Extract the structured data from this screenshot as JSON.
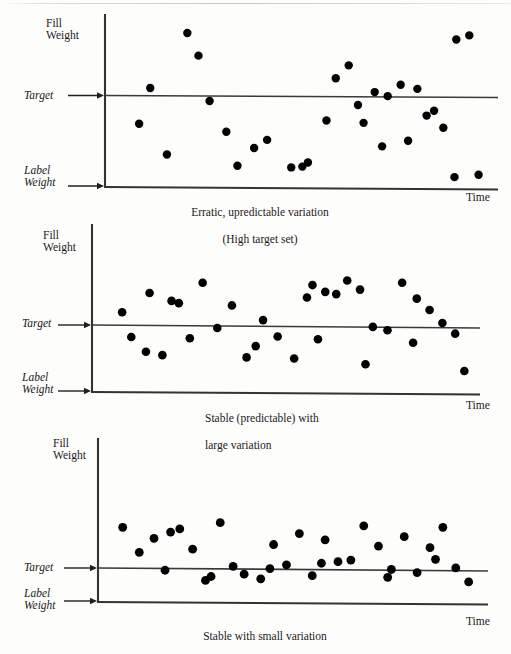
{
  "page": {
    "background_color": "#fdfdfc",
    "ink_color": "#000000",
    "axis_color": "#333333"
  },
  "common_labels": {
    "fill_weight": "Fill\nWeight",
    "fill_weight_line1": "Fill",
    "fill_weight_line2": "Weight",
    "target": "Target",
    "label_weight_line1": "Label",
    "label_weight_line2": "Weight",
    "time": "Time"
  },
  "chart_data": [
    {
      "id": "chart-erratic",
      "type": "scatter",
      "title": "",
      "caption": "Erratic, upredictable variation\n(High target set)",
      "caption_line1": "Erratic, upredictable variation",
      "caption_line2": "(High target set)",
      "caption_align": "center",
      "xlabel": "Time",
      "ylabel": "Fill Weight",
      "ylim": [
        0,
        100
      ],
      "xlim": [
        0,
        100
      ],
      "grid": false,
      "legend": "none",
      "annotations": [
        {
          "name": "Target",
          "y": 55.0,
          "style": "horizontal-line-with-arrow"
        },
        {
          "name": "Label Weight",
          "y": 0.0,
          "style": "axis-with-arrow"
        }
      ],
      "target_level": 55.0,
      "label_weight_level": 0.0,
      "x": [
        6.5,
        19.5,
        25.5,
        22.5,
        9.5,
        14.0,
        33.0,
        37.5,
        30.0,
        41.0,
        47.5,
        52.0,
        57.0,
        50.5,
        63.0,
        65.5,
        70.0,
        59.5,
        73.5,
        77.0,
        81.5,
        86.0,
        72.0,
        67.0,
        84.0,
        88.5,
        79.0,
        92.0,
        95.5,
        98.0,
        91.5,
        27.0,
        44.0
      ],
      "y": [
        36.0,
        92.0,
        50.0,
        78.0,
        58.0,
        17.0,
        10.0,
        21.0,
        31.0,
        26.0,
        9.0,
        12.0,
        38.0,
        9.5,
        72.0,
        47.5,
        55.5,
        64.0,
        53.0,
        60.0,
        57.5,
        44.0,
        22.0,
        36.5,
        41.0,
        33.5,
        25.5,
        88.0,
        90.5,
        4.5,
        3.0
      ],
      "point_count": 33,
      "point_radius_px": 4.2
    },
    {
      "id": "chart-stable-large",
      "type": "scatter",
      "title": "",
      "caption": "Stable (predictable) with\nlarge variation",
      "caption_line1": "Stable (predictable) with",
      "caption_line2": "large variation",
      "caption_align": "left",
      "xlabel": "Time",
      "ylabel": "Fill Weight",
      "ylim": [
        0,
        100
      ],
      "xlim": [
        0,
        100
      ],
      "grid": false,
      "legend": "none",
      "annotations": [
        {
          "name": "Target",
          "y": 50.0,
          "style": "horizontal-line-with-arrow"
        },
        {
          "name": "Label Weight",
          "y": 0.0,
          "style": "axis-with-arrow"
        }
      ],
      "target_level": 50.0,
      "label_weight_level": 0.0,
      "x": [
        5.5,
        8.0,
        13.0,
        16.5,
        21.0,
        27.5,
        31.5,
        35.5,
        39.5,
        44.0,
        48.0,
        52.5,
        56.0,
        57.5,
        61.0,
        64.0,
        67.0,
        70.5,
        74.0,
        78.0,
        82.0,
        86.0,
        89.5,
        93.0,
        96.5,
        12.0,
        19.0,
        24.0,
        42.0,
        59.0,
        72.0,
        85.0,
        99.0
      ],
      "y": [
        60.0,
        38.0,
        77.0,
        22.0,
        68.0,
        86.0,
        46.0,
        66.0,
        20.0,
        53.0,
        38.5,
        19.0,
        73.0,
        84.0,
        78.0,
        76.0,
        88.0,
        80.0,
        47.0,
        44.0,
        86.0,
        72.0,
        62.0,
        50.5,
        41.0,
        25.0,
        70.0,
        37.0,
        30.0,
        36.0,
        14.0,
        33.0,
        8.0
      ],
      "point_count": 33,
      "point_radius_px": 4.3
    },
    {
      "id": "chart-stable-small",
      "type": "scatter",
      "title": "",
      "caption": "Stable with small variation",
      "caption_line1": "Stable with small variation",
      "caption_line2": "",
      "caption_align": "center",
      "xlabel": "Time",
      "ylabel": "Fill Weight",
      "ylim": [
        0,
        100
      ],
      "xlim": [
        0,
        100
      ],
      "grid": false,
      "legend": "none",
      "annotations": [
        {
          "name": "Target",
          "y": 50.0,
          "style": "horizontal-line-with-arrow"
        },
        {
          "name": "Label Weight",
          "y": 0.0,
          "style": "axis-with-arrow"
        }
      ],
      "target_level": 50.0,
      "label_weight_level": 0.0,
      "x": [
        4.0,
        8.5,
        12.5,
        15.5,
        19.5,
        23.0,
        26.5,
        30.5,
        34.0,
        37.0,
        41.5,
        45.0,
        48.5,
        52.0,
        55.5,
        59.0,
        62.5,
        66.0,
        69.5,
        73.5,
        77.0,
        80.5,
        84.0,
        87.5,
        91.0,
        94.5,
        98.0,
        17.0,
        28.0,
        44.0,
        58.0,
        76.0,
        89.0
      ],
      "y": [
        88.0,
        56.0,
        74.0,
        33.0,
        86.0,
        60.0,
        20.0,
        94.0,
        38.0,
        28.0,
        22.0,
        66.0,
        40.0,
        80.0,
        26.0,
        72.0,
        44.0,
        46.0,
        90.0,
        64.0,
        34.0,
        76.0,
        30.0,
        62.0,
        88.0,
        36.0,
        18.0,
        82.0,
        25.0,
        35.0,
        42.0,
        24.0,
        47.0
      ],
      "point_count": 33,
      "point_radius_px": 4.4
    }
  ]
}
